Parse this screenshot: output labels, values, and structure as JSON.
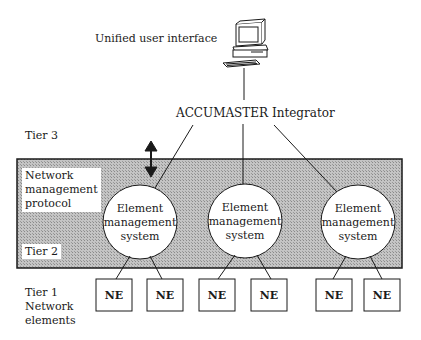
{
  "diagram": {
    "top_label": "Unified user interface",
    "integrator_label": "ACCUMASTER Integrator",
    "tiers": {
      "tier3": "Tier 3",
      "tier2": "Tier 2",
      "tier1_line1": "Tier 1",
      "tier1_line2": "Network",
      "tier1_line3": "elements"
    },
    "protocol_label": {
      "line1": "Network",
      "line2": "management",
      "line3": "protocol"
    },
    "element_management_systems": [
      {
        "line1": "Element",
        "line2": "management",
        "line3": "system"
      },
      {
        "line1": "Element",
        "line2": "management",
        "line3": "system"
      },
      {
        "line1": "Element",
        "line2": "management",
        "line3": "system"
      }
    ],
    "network_elements": [
      "NE",
      "NE",
      "NE",
      "NE",
      "NE",
      "NE"
    ],
    "icons": {
      "workstation": "computer-terminal-icon",
      "protocol_arrow": "bidirectional-arrow-icon"
    },
    "colors": {
      "shaded_region": "#b8b8b8",
      "ink": "#1a1a1a",
      "background": "#ffffff"
    }
  }
}
